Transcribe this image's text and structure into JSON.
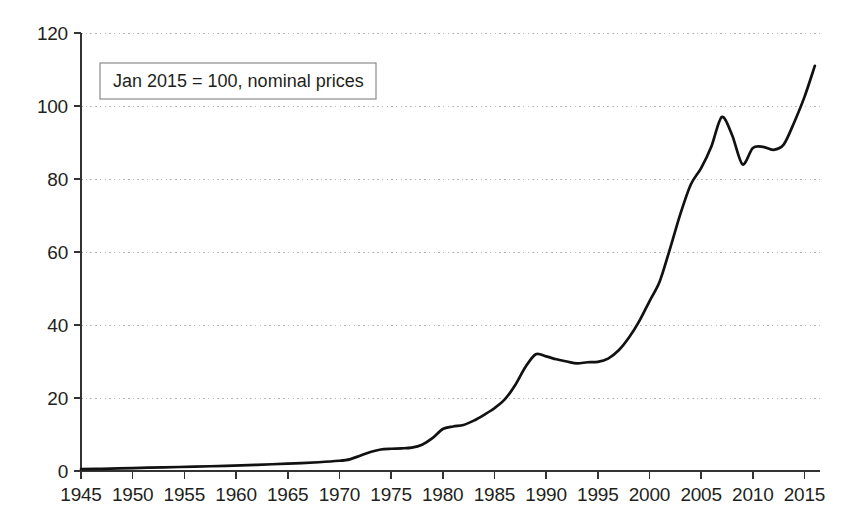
{
  "chart_data": {
    "type": "line",
    "title": "",
    "subtitle": "",
    "xlabel": "",
    "ylabel": "",
    "annotation": "Jan 2015 = 100, nominal prices",
    "grid": "horizontal-dotted",
    "legend": "none",
    "xlim": [
      1945,
      2016.5
    ],
    "ylim": [
      0,
      120
    ],
    "xticks": [
      1945,
      1950,
      1955,
      1960,
      1965,
      1970,
      1975,
      1980,
      1985,
      1990,
      1995,
      2000,
      2005,
      2010,
      2015
    ],
    "xtick_labels": [
      "1945",
      "1950",
      "1955",
      "1960",
      "1965",
      "1970",
      "1975",
      "1980",
      "1985",
      "1990",
      "1995",
      "2000",
      "2005",
      "2010",
      "2015"
    ],
    "yticks": [
      0,
      20,
      40,
      60,
      80,
      100,
      120
    ],
    "ytick_labels": [
      "0",
      "20",
      "40",
      "60",
      "80",
      "100",
      "120"
    ],
    "series": [
      {
        "name": "Nominal price index",
        "color": "#111111",
        "x": [
          1945,
          1947,
          1950,
          1953,
          1956,
          1959,
          1962,
          1965,
          1968,
          1970,
          1971,
          1972,
          1973,
          1974,
          1975,
          1976,
          1977,
          1978,
          1979,
          1980,
          1981,
          1982,
          1983,
          1984,
          1985,
          1986,
          1987,
          1988,
          1989,
          1990,
          1991,
          1992,
          1993,
          1994,
          1995,
          1996,
          1997,
          1998,
          1999,
          2000,
          2001,
          2002,
          2003,
          2004,
          2005,
          2006,
          2007,
          2008,
          2009,
          2010,
          2011,
          2012,
          2013,
          2014,
          2015,
          2016
        ],
        "y": [
          0.5,
          0.6,
          0.8,
          1.0,
          1.2,
          1.4,
          1.7,
          2.0,
          2.4,
          2.8,
          3.2,
          4.2,
          5.2,
          5.9,
          6.1,
          6.2,
          6.4,
          7.2,
          9.0,
          11.5,
          12.2,
          12.6,
          13.8,
          15.4,
          17.2,
          19.6,
          23.5,
          28.5,
          32.0,
          31.4,
          30.6,
          30.0,
          29.5,
          29.8,
          29.9,
          30.8,
          33.0,
          36.5,
          41.0,
          46.5,
          52.0,
          61.0,
          70.5,
          78.5,
          83.0,
          89.0,
          97.0,
          92.0,
          84.0,
          88.5,
          88.8,
          88.0,
          89.5,
          95.5,
          102.5,
          111.0
        ]
      }
    ]
  },
  "axes": {
    "y_axis_name": "value-axis",
    "x_axis_name": "year-axis"
  },
  "annotation_box": {
    "label": "Jan 2015 = 100, nominal prices",
    "border_color": "#8b8b8b",
    "background": "#ffffff"
  },
  "style": {
    "line_color": "#111111",
    "grid_color": "#b9b9bd",
    "axis_color": "#333333",
    "text_color": "#231f20",
    "background": "#ffffff"
  }
}
